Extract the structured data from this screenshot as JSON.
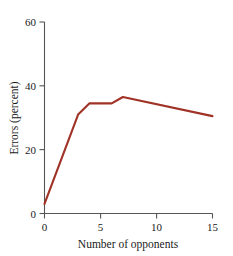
{
  "chart_data": {
    "type": "line",
    "title": "",
    "xlabel": "Number of opponents",
    "ylabel": "Errors (percent)",
    "xlim": [
      0,
      15
    ],
    "ylim": [
      0,
      60
    ],
    "xticks": [
      0,
      5,
      10,
      15
    ],
    "xtick_labels": [
      "0",
      "5",
      "10",
      "15"
    ],
    "yticks": [
      0,
      20,
      40,
      60
    ],
    "ytick_labels": [
      "0",
      "20",
      "40",
      "60"
    ],
    "grid": false,
    "legend": false,
    "legend_position": "none",
    "line_color": "#A03326",
    "axis_color": "#555555",
    "background_color": "#FFFFFF",
    "x": [
      0,
      3,
      4,
      6,
      7,
      15
    ],
    "series": [
      {
        "name": "Errors",
        "values": [
          3,
          31,
          34.5,
          34.5,
          36.5,
          30.5
        ]
      }
    ],
    "points": [
      {
        "x": 0,
        "y": 3
      },
      {
        "x": 3,
        "y": 31
      },
      {
        "x": 4,
        "y": 34.5
      },
      {
        "x": 6,
        "y": 34.5
      },
      {
        "x": 7,
        "y": 36.5
      },
      {
        "x": 15,
        "y": 30.5
      }
    ]
  }
}
